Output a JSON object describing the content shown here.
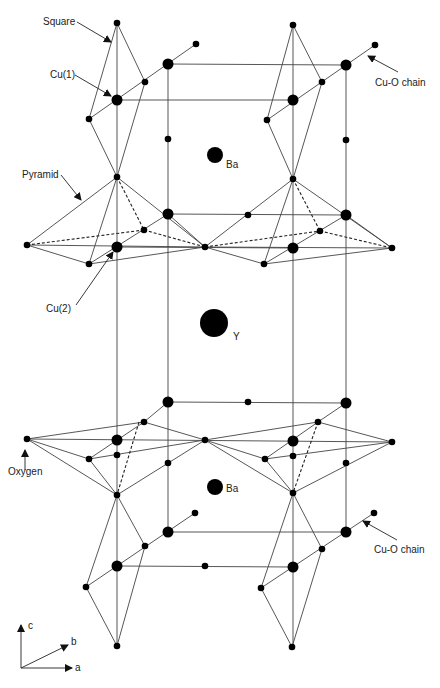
{
  "diagram": {
    "colors": {
      "line": "#444444",
      "atom": "#000000",
      "background": "#ffffff"
    },
    "labels": {
      "square": "Square",
      "cu1": "Cu(1)",
      "pyramid": "Pyramid",
      "cu2": "Cu(2)",
      "cuo_chain_top": "Cu-O chain",
      "cuo_chain_bottom": "Cu-O chain",
      "ba_top": "Ba",
      "ba_bottom": "Ba",
      "y": "Y",
      "oxygen": "Oxygen"
    },
    "axes": {
      "c": "c",
      "b": "b",
      "a": "a"
    }
  }
}
